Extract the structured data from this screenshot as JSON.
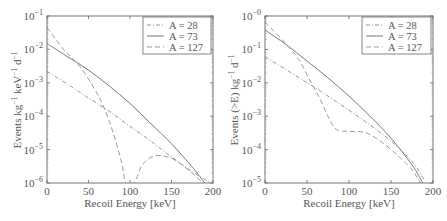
{
  "chart_data": [
    {
      "type": "line",
      "title": "",
      "xlabel": "Recoil Energy [keV]",
      "ylabel": "Events kg⁻¹ keV⁻¹ d⁻¹",
      "yscale": "log",
      "xlim": [
        0,
        200
      ],
      "ylim": [
        1e-06,
        0.1
      ],
      "xticks": [
        "0",
        "50",
        "100",
        "150",
        "200"
      ],
      "yticks": [
        "10⁻⁶",
        "10⁻⁵",
        "10⁻⁴",
        "10⁻³",
        "10⁻²",
        "10⁻¹"
      ],
      "grid": false,
      "legend_position": "upper right",
      "series": [
        {
          "name": "A = 28",
          "style": "dash-dot",
          "x": [
            0,
            25,
            50,
            75,
            100,
            125,
            150,
            175,
            200
          ],
          "y": [
            0.0022,
            0.0009,
            0.00035,
            0.00014,
            5e-05,
            1.8e-05,
            6e-06,
            2.2e-06,
            9e-07
          ]
        },
        {
          "name": "A = 73",
          "style": "solid",
          "x": [
            0,
            25,
            50,
            75,
            100,
            125,
            150,
            175,
            190
          ],
          "y": [
            0.015,
            0.006,
            0.0024,
            0.0008,
            0.00024,
            6e-05,
            1.5e-05,
            3e-06,
            1e-06
          ]
        },
        {
          "name": "A = 127",
          "style": "dashed",
          "x": [
            0,
            20,
            40,
            60,
            70,
            80,
            90,
            95,
            105,
            115,
            130,
            150,
            170,
            190
          ],
          "y": [
            0.045,
            0.01,
            0.003,
            0.0005,
            0.00015,
            3e-05,
            4e-06,
            1e-06,
            1e-06,
            3.5e-06,
            6.5e-06,
            5.5e-06,
            2.5e-06,
            8e-07
          ]
        }
      ]
    },
    {
      "type": "line",
      "title": "",
      "xlabel": "Recoil Energy [keV]",
      "ylabel": "Events (>E) kg⁻¹ d⁻¹",
      "yscale": "log",
      "xlim": [
        0,
        200
      ],
      "ylim": [
        1e-05,
        1
      ],
      "xticks": [
        "0",
        "50",
        "100",
        "150",
        "200"
      ],
      "yticks": [
        "10⁻⁵",
        "10⁻⁴",
        "10⁻³",
        "10⁻²",
        "10⁻¹",
        "10⁻⁰"
      ],
      "grid": false,
      "legend_position": "upper right",
      "series": [
        {
          "name": "A = 28",
          "style": "dash-dot",
          "x": [
            0,
            25,
            50,
            75,
            100,
            125,
            150,
            175,
            190
          ],
          "y": [
            0.06,
            0.025,
            0.01,
            0.004,
            0.0015,
            0.00055,
            0.00018,
            4.5e-05,
            1.2e-05
          ]
        },
        {
          "name": "A = 73",
          "style": "solid",
          "x": [
            0,
            25,
            50,
            75,
            100,
            125,
            150,
            175,
            188
          ],
          "y": [
            0.38,
            0.14,
            0.045,
            0.014,
            0.004,
            0.001,
            0.00022,
            3.5e-05,
            1e-05
          ]
        },
        {
          "name": "A = 127",
          "style": "dashed",
          "x": [
            0,
            20,
            40,
            55,
            65,
            75,
            85,
            100,
            120,
            140,
            160,
            175,
            185
          ],
          "y": [
            0.65,
            0.2,
            0.05,
            0.01,
            0.0035,
            0.001,
            0.0004,
            0.00035,
            0.00032,
            0.00016,
            6e-05,
            2.5e-05,
            1e-05
          ]
        }
      ]
    }
  ],
  "legend": [
    "A = 28",
    "A = 73",
    "A = 127"
  ],
  "left_plot": {
    "ylabel_main": "Events kg",
    "ylabel_rest": " keV",
    "ylabel_end": " d",
    "sup": "−1",
    "xlabel": "Recoil Energy [keV]"
  },
  "right_plot": {
    "ylabel_main": "Events (>E) kg",
    "ylabel_end": " d",
    "sup": "−1",
    "xlabel": "Recoil Energy [keV]"
  },
  "ticks": {
    "x": [
      "0",
      "50",
      "100",
      "150",
      "200"
    ],
    "left_y_exp": [
      "−6",
      "−5",
      "−4",
      "−3",
      "−2",
      "−1"
    ],
    "right_y_exp": [
      "−5",
      "−4",
      "−3",
      "−2",
      "−1",
      "−0"
    ],
    "base": "10"
  }
}
